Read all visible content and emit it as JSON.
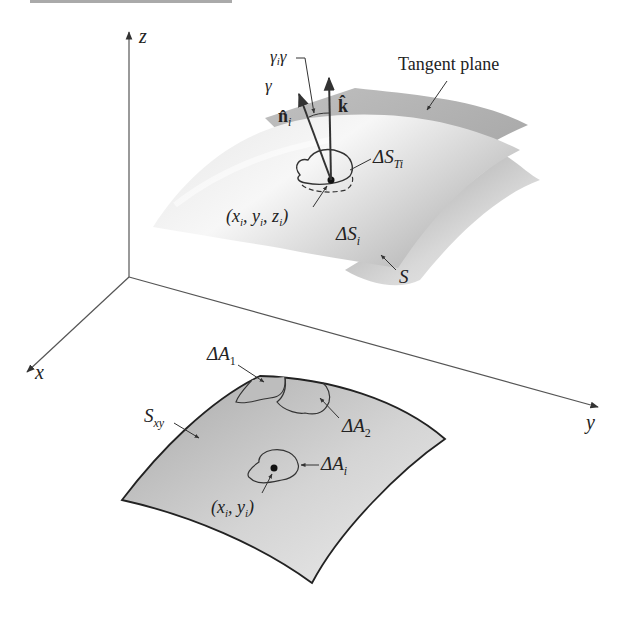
{
  "figure": {
    "axes": {
      "z": "z",
      "x": "x",
      "y": "y"
    },
    "labels": {
      "tangent_plane": "Tangent plane",
      "gamma_i_gamma": "γ",
      "gamma_i_sub": "i",
      "gamma_i_tail": "γ",
      "gamma": "γ",
      "n_hat": "n̂",
      "n_sub": "i",
      "k_hat": "k̂",
      "delta_S_Ti": "ΔS",
      "delta_S_Ti_sub": "Ti",
      "point_xyz": "(x",
      "point_xyz_i1": "i",
      "point_xyz_mid1": ", y",
      "point_xyz_i2": "i",
      "point_xyz_mid2": ", z",
      "point_xyz_i3": "i",
      "point_xyz_close": ")",
      "delta_S_i": "ΔS",
      "delta_S_i_sub": "i",
      "S": "S",
      "delta_A_1": "ΔA",
      "delta_A_1_sub": "1",
      "delta_A_2": "ΔA",
      "delta_A_2_sub": "2",
      "S_xy": "S",
      "S_xy_sub": "xy",
      "delta_A_i": "ΔA",
      "delta_A_i_sub": "i",
      "point_xy": "(x",
      "point_xy_i1": "i",
      "point_xy_mid": ", y",
      "point_xy_i2": "i",
      "point_xy_close": ")"
    },
    "colors": {
      "surface_light": "#f2f2f2",
      "surface_mid": "#c8c8c8",
      "surface_dark": "#8f8f8f",
      "line": "#333333",
      "axis": "#555555"
    }
  }
}
